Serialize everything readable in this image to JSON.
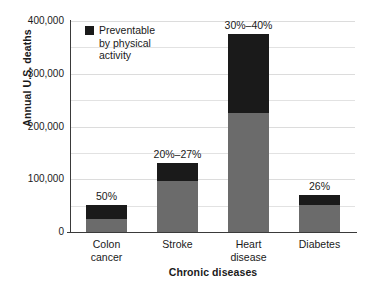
{
  "chart_data": {
    "type": "bar",
    "subtype": "stacked-bar",
    "title": "",
    "xlabel": "Chronic diseases",
    "ylabel": "Annual U.S. deaths",
    "ylim": [
      0,
      400000
    ],
    "yticks": [
      0,
      100000,
      200000,
      300000,
      400000
    ],
    "ytick_labels": [
      "0",
      "100,000",
      "200,000",
      "300,000",
      "400,000"
    ],
    "grid": true,
    "gridlines_minor_step": 50000,
    "categories": [
      "Colon cancer",
      "Stroke",
      "Heart disease",
      "Diabetes"
    ],
    "category_labels": [
      [
        "Colon",
        "cancer"
      ],
      [
        "Stroke"
      ],
      [
        "Heart",
        "disease"
      ],
      [
        "Diabetes"
      ]
    ],
    "series": [
      {
        "name": "Not preventable",
        "color": "#6b6b6b",
        "values": [
          25000,
          96000,
          225000,
          52000
        ]
      },
      {
        "name": "Preventable by physical activity",
        "color": "#1a1a1a",
        "values": [
          27000,
          34000,
          150000,
          18000
        ]
      }
    ],
    "totals": [
      52000,
      130000,
      375000,
      70000
    ],
    "annotations": [
      "50%",
      "20%–27%",
      "30%–40%",
      "26%"
    ],
    "legend": {
      "position": "upper left (inside plot)",
      "entries": [
        {
          "label": "Preventable\nby physical\nactivity",
          "color": "#1a1a1a"
        }
      ]
    },
    "colors": {
      "background": "#ffffff",
      "base_segment": "#6b6b6b",
      "preventable_segment": "#1a1a1a",
      "axis": "#3a3a3a",
      "gridline": "#e2e2e2",
      "text": "#1a1a1a"
    }
  }
}
